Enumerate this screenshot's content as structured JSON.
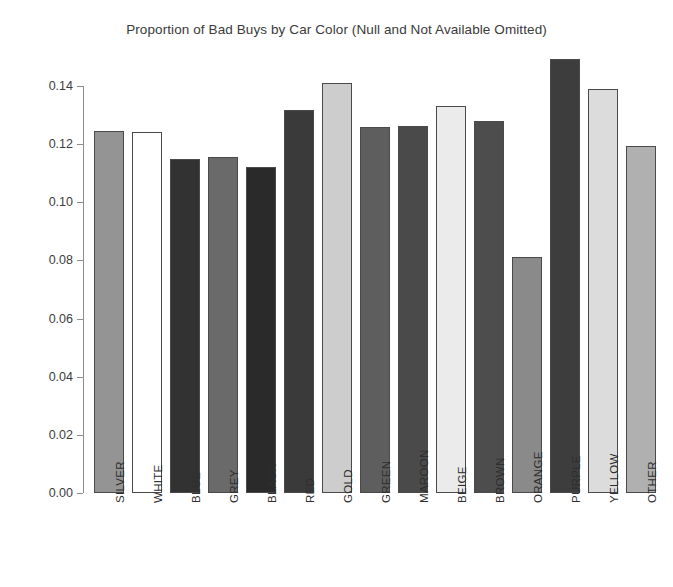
{
  "figure": {
    "background_color": "#ffffff",
    "width": 673,
    "height": 587
  },
  "chart_data": {
    "type": "bar",
    "title": "Proportion of Bad Buys by Car Color (Null and Not Available Omitted)",
    "xlabel": "",
    "ylabel": "",
    "categories": [
      "SILVER",
      "WHITE",
      "BLUE",
      "GREY",
      "BLACK",
      "RED",
      "GOLD",
      "GREEN",
      "MAROON",
      "BEIGE",
      "BROWN",
      "ORANGE",
      "PURPLE",
      "YELLOW",
      "OTHER"
    ],
    "values": [
      0.1245,
      0.1243,
      0.115,
      0.1155,
      0.1122,
      0.1317,
      0.141,
      0.1258,
      0.1262,
      0.133,
      0.128,
      0.0812,
      0.1492,
      0.139,
      0.1192
    ],
    "bar_colors": [
      "#949494",
      "#ffffff",
      "#323232",
      "#6a6a6a",
      "#2a2a2a",
      "#3a3a3a",
      "#cdcdcd",
      "#5e5e5e",
      "#4a4a4a",
      "#ebebeb",
      "#4d4d4d",
      "#8a8a8a",
      "#3d3d3d",
      "#dcdcdc",
      "#b0b0b0"
    ],
    "ylim": [
      0.0,
      0.14
    ],
    "yticks": [
      0.0,
      0.02,
      0.04,
      0.06,
      0.08,
      0.1,
      0.12,
      0.14
    ],
    "ytick_labels": [
      "0.00",
      "0.02",
      "0.04",
      "0.06",
      "0.08",
      "0.10",
      "0.12",
      "0.14"
    ],
    "grid": false,
    "legend": "none",
    "xtick_label_rotation": -90,
    "axis_color": "#8c8c8c",
    "bar_edge_color": "#4a4a4a",
    "text_color": "#3c3c3c"
  }
}
